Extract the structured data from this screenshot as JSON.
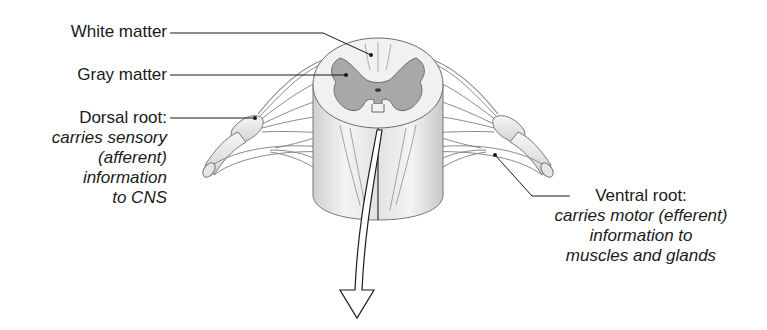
{
  "figure": {
    "type": "anatomical-diagram",
    "colors": {
      "background": "#ffffff",
      "white_matter": "#f1f1ef",
      "gray_matter": "#a8a8a6",
      "outline": "#6b6b6b",
      "leader_line": "#1a1a1a",
      "text": "#1a1a1a"
    }
  },
  "labels": {
    "white_matter": {
      "title": "White matter"
    },
    "gray_matter": {
      "title": "Gray matter"
    },
    "dorsal_root": {
      "title": "Dorsal root:",
      "desc_lines": [
        "carries sensory",
        "(afferent)",
        "information",
        "to CNS"
      ]
    },
    "ventral_root": {
      "title": "Ventral root:",
      "desc_lines": [
        "carries motor (efferent)",
        "information to",
        "muscles and glands"
      ]
    }
  },
  "arrow": {
    "direction": "down",
    "meaning": "continuation of spinal cord"
  }
}
